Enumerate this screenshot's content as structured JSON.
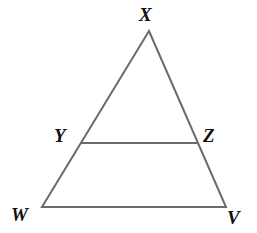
{
  "figure": {
    "kind": "geometry-diagram",
    "background_color": "#ffffff",
    "stroke_color": "#6b6b6b",
    "stroke_width": 2,
    "label_color": "#111111",
    "canvas": {
      "width": 257,
      "height": 233
    },
    "vertices": {
      "X": {
        "label": "X",
        "x": 149,
        "y": 31
      },
      "W": {
        "label": "W",
        "x": 42,
        "y": 207
      },
      "V": {
        "label": "V",
        "x": 226,
        "y": 207
      },
      "Y": {
        "label": "Y",
        "x": 80,
        "y": 143
      },
      "Z": {
        "label": "Z",
        "x": 197,
        "y": 143
      }
    },
    "segments": [
      {
        "name": "XW",
        "from": "X",
        "to": "W"
      },
      {
        "name": "XV",
        "from": "X",
        "to": "V"
      },
      {
        "name": "WV",
        "from": "W",
        "to": "V"
      },
      {
        "name": "YZ",
        "from": "Y",
        "to": "Z"
      }
    ]
  }
}
